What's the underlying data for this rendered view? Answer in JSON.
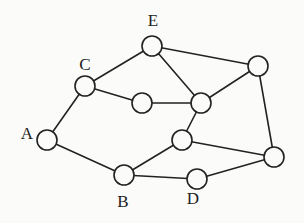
{
  "diagram": {
    "type": "graph",
    "background": "#fbfbf9",
    "stroke_color": "#222222",
    "node_radius": 10,
    "nodes": [
      {
        "id": "A",
        "label": "A",
        "x": 47,
        "y": 140,
        "label_x": 27,
        "label_y": 135
      },
      {
        "id": "B",
        "label": "B",
        "x": 124,
        "y": 175,
        "label_x": 123,
        "label_y": 203
      },
      {
        "id": "C",
        "label": "C",
        "x": 85,
        "y": 86,
        "label_x": 85,
        "label_y": 66
      },
      {
        "id": "D",
        "label": "D",
        "x": 197,
        "y": 179,
        "label_x": 193,
        "label_y": 200
      },
      {
        "id": "E",
        "label": "E",
        "x": 152,
        "y": 46,
        "label_x": 153,
        "label_y": 22
      },
      {
        "id": "N1",
        "label": "",
        "x": 142,
        "y": 103
      },
      {
        "id": "N2",
        "label": "",
        "x": 201,
        "y": 103
      },
      {
        "id": "N3",
        "label": "",
        "x": 258,
        "y": 66
      },
      {
        "id": "N4",
        "label": "",
        "x": 182,
        "y": 140
      },
      {
        "id": "N5",
        "label": "",
        "x": 274,
        "y": 157
      }
    ],
    "edges": [
      [
        "A",
        "C"
      ],
      [
        "A",
        "B"
      ],
      [
        "C",
        "E"
      ],
      [
        "C",
        "N1"
      ],
      [
        "E",
        "N2"
      ],
      [
        "E",
        "N3"
      ],
      [
        "N1",
        "N2"
      ],
      [
        "N2",
        "N3"
      ],
      [
        "N2",
        "N4"
      ],
      [
        "N3",
        "N5"
      ],
      [
        "N4",
        "B"
      ],
      [
        "N4",
        "N5"
      ],
      [
        "B",
        "D"
      ],
      [
        "D",
        "N5"
      ]
    ]
  }
}
